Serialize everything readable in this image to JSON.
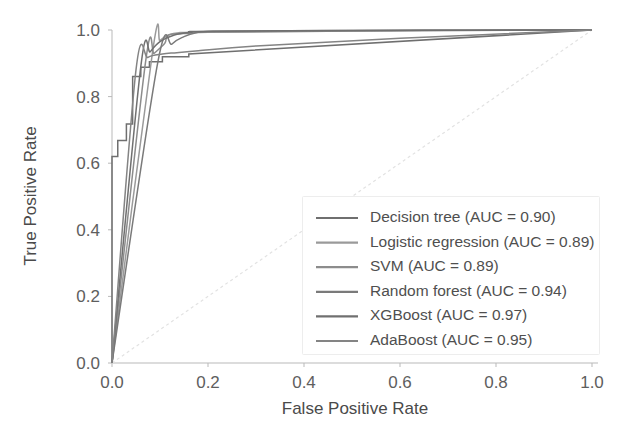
{
  "chart_data": {
    "type": "line",
    "title": "",
    "xlabel": "False Positive Rate",
    "ylabel": "True Positive Rate",
    "xlim": [
      0.0,
      1.0
    ],
    "ylim": [
      0.0,
      1.0
    ],
    "xticks": [
      "0.0",
      "0.2",
      "0.4",
      "0.6",
      "0.8",
      "1.0"
    ],
    "yticks": [
      "0.0",
      "0.2",
      "0.4",
      "0.6",
      "0.8",
      "1.0"
    ],
    "xtick_values": [
      0.0,
      0.2,
      0.4,
      0.6,
      0.8,
      1.0
    ],
    "ytick_values": [
      0.0,
      0.2,
      0.4,
      0.6,
      0.8,
      1.0
    ],
    "grid": false,
    "legend_position": "lower right",
    "reference_line": {
      "name": "chance-diagonal",
      "x": [
        0.0,
        1.0
      ],
      "y": [
        0.0,
        1.0
      ],
      "style": "dotted",
      "color": "#e2e2e2"
    },
    "series": [
      {
        "name": "Decision tree",
        "auc": "0.90",
        "legend_label": "Decision tree (AUC = 0.90)",
        "color": "#6f6f6f",
        "style": "step",
        "x": [
          0.0,
          0.0,
          0.012,
          0.012,
          0.03,
          0.03,
          0.043,
          0.043,
          0.06,
          0.06,
          0.078,
          0.078,
          0.105,
          0.105,
          0.16,
          0.16,
          1.0
        ],
        "y": [
          0.0,
          0.62,
          0.62,
          0.668,
          0.668,
          0.718,
          0.718,
          0.86,
          0.86,
          0.888,
          0.888,
          0.905,
          0.905,
          0.92,
          0.92,
          0.928,
          1.0
        ]
      },
      {
        "name": "Logistic regression",
        "auc": "0.89",
        "legend_label": "Logistic regression (AUC = 0.89)",
        "color": "#9a9a9a",
        "style": "smooth",
        "x": [
          0.0,
          0.085,
          0.1,
          0.118,
          0.14,
          0.2,
          0.4,
          0.7,
          1.0
        ],
        "y": [
          0.0,
          0.94,
          0.968,
          0.985,
          0.992,
          0.995,
          0.997,
          0.999,
          1.0
        ]
      },
      {
        "name": "SVM",
        "auc": "0.89",
        "legend_label": "SVM (AUC = 0.89)",
        "color": "#8c8c8c",
        "style": "smooth",
        "x": [
          0.0,
          0.07,
          0.088,
          0.11,
          0.118,
          0.16,
          0.2,
          0.5,
          1.0
        ],
        "y": [
          0.0,
          0.905,
          0.93,
          0.96,
          0.985,
          0.99,
          0.993,
          0.997,
          1.0
        ]
      },
      {
        "name": "Random forest",
        "auc": "0.94",
        "legend_label": "Random forest (AUC = 0.94)",
        "color": "#7a7a7a",
        "style": "smooth",
        "x": [
          0.0,
          0.095,
          0.125,
          0.15,
          0.175,
          0.21,
          0.35,
          0.65,
          1.0
        ],
        "y": [
          0.0,
          0.9,
          0.958,
          0.98,
          0.992,
          0.996,
          0.998,
          0.999,
          1.0
        ]
      },
      {
        "name": "XGBoost",
        "auc": "0.97",
        "legend_label": "XGBoost (AUC = 0.97)",
        "color": "#707070",
        "style": "smooth",
        "x": [
          0.0,
          0.06,
          0.08,
          0.1,
          0.13,
          0.165,
          0.2,
          0.6,
          1.0
        ],
        "y": [
          0.0,
          0.89,
          0.935,
          0.965,
          0.985,
          0.993,
          0.996,
          0.999,
          1.0
        ]
      },
      {
        "name": "AdaBoost",
        "auc": "0.95",
        "legend_label": "AdaBoost (AUC = 0.95)",
        "color": "#848484",
        "style": "smooth",
        "x": [
          0.0,
          0.05,
          0.075,
          0.105,
          0.135,
          0.18,
          0.3,
          0.6,
          1.0
        ],
        "y": [
          0.0,
          0.88,
          0.918,
          0.928,
          0.932,
          0.938,
          0.952,
          0.975,
          1.0
        ]
      }
    ]
  }
}
